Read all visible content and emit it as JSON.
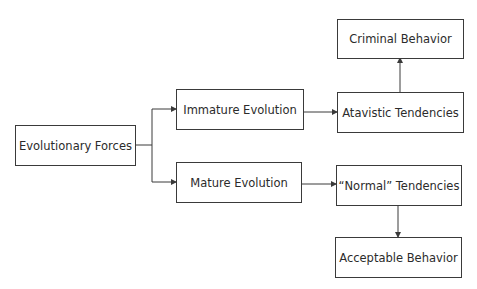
{
  "diagram": {
    "nodes": {
      "evolutionary_forces": "Evolutionary Forces",
      "immature_evolution": "Immature Evolution",
      "mature_evolution": "Mature Evolution",
      "atavistic_tendencies": "Atavistic Tendencies",
      "normal_tendencies": "“Normal” Tendencies",
      "criminal_behavior": "Criminal Behavior",
      "acceptable_behavior": "Acceptable Behavior"
    },
    "edges": [
      {
        "from": "Evolutionary Forces",
        "to": "Immature Evolution"
      },
      {
        "from": "Evolutionary Forces",
        "to": "Mature Evolution"
      },
      {
        "from": "Immature Evolution",
        "to": "Atavistic Tendencies"
      },
      {
        "from": "Mature Evolution",
        "to": "“Normal” Tendencies"
      },
      {
        "from": "Atavistic Tendencies",
        "to": "Criminal Behavior"
      },
      {
        "from": "“Normal” Tendencies",
        "to": "Acceptable Behavior"
      }
    ],
    "colors": {
      "line": "#3a3a3a",
      "text": "#2b2b2b",
      "background": "#ffffff"
    }
  }
}
